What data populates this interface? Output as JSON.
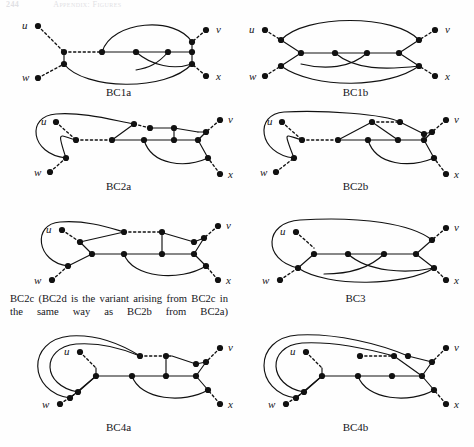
{
  "page": {
    "running_head_folio": "244",
    "running_head_title": "Appendix: Figures",
    "width": 474,
    "height": 447,
    "background": "#fefefe",
    "ink_color": "#111111"
  },
  "figures": [
    {
      "id": "bc1a",
      "caption": "BC1a",
      "terminal_labels": [
        "u",
        "v",
        "w",
        "x"
      ],
      "node_count": 10,
      "dashed_edge_count": 3,
      "description": "Two branch vertices on the left joined by a dashed edge to a path of four vertices; two long arcs from the left-inner vertex to the right side plus a crossing pair near the right."
    },
    {
      "id": "bc1b",
      "caption": "BC1b",
      "terminal_labels": [
        "u",
        "v",
        "w",
        "x"
      ],
      "node_count": 10,
      "dashed_edge_count": 4,
      "description": "Symmetric variant of BC1a with the upper arc running from the u-side vertex over the top to the v-side vertex and a crossing pair in the middle."
    },
    {
      "id": "bc2a",
      "caption": "BC2a",
      "terminal_labels": [
        "u",
        "v",
        "w",
        "x"
      ],
      "node_count": 12,
      "dashed_edge_count": 3,
      "description": "A large loop encircles the u vertex on the left; an upper path with a dashed segment leads to the right, a vertical rung joins upper and lower paths, and a long lower arc returns to the x side."
    },
    {
      "id": "bc2b",
      "caption": "BC2b",
      "terminal_labels": [
        "u",
        "v",
        "w",
        "x"
      ],
      "node_count": 12,
      "dashed_edge_count": 3,
      "description": "Variant of BC2a in which the upper path forms a peak over the lower path instead of a vertical rung."
    },
    {
      "id": "bc2c",
      "caption": "BC2c (BC2d is the variant arising from BC2c in the same way as BC2b from BC2a)",
      "caption_is_block": true,
      "terminal_labels": [
        "u",
        "v",
        "w",
        "x"
      ],
      "node_count": 12,
      "dashed_edge_count": 3,
      "description": "Loop around u on the left, upper path with a long dashed middle segment, a vertical rung to the lower path and a lower arc swinging to the x side."
    },
    {
      "id": "bc3",
      "caption": "BC3",
      "terminal_labels": [
        "u",
        "v",
        "w",
        "x"
      ],
      "node_count": 10,
      "dashed_edge_count": 3,
      "description": "A single wide loop over the top from the w-side vertex to the v-side vertex, a central horizontal path of four vertices, and two crossing arcs beneath it."
    },
    {
      "id": "bc4a",
      "caption": "BC4a",
      "terminal_labels": [
        "u",
        "v",
        "w",
        "x"
      ],
      "node_count": 12,
      "dashed_edge_count": 3,
      "description": "Two nested loops sweep around the left past u; the upper path carries a dashed segment, a vertical rung joins the two paths, and a lower arc returns toward x."
    },
    {
      "id": "bc4b",
      "caption": "BC4b",
      "terminal_labels": [
        "u",
        "v",
        "w",
        "x"
      ],
      "node_count": 12,
      "dashed_edge_count": 3,
      "description": "Variant of BC4a with the upper path descending directly to the right junction instead of using a vertical rung."
    }
  ]
}
